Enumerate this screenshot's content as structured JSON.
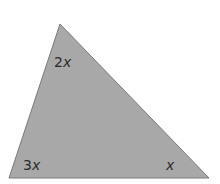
{
  "diagram": {
    "type": "triangle",
    "fill_color": "#a8a8a8",
    "stroke_color": "#7a7a7a",
    "vertices": {
      "top": [
        60,
        24
      ],
      "bottom_left": [
        9,
        178
      ],
      "bottom_right": [
        209,
        178
      ]
    },
    "angles": [
      {
        "position": "top",
        "coefficient": "2",
        "variable": "x"
      },
      {
        "position": "bottom_left",
        "coefficient": "3",
        "variable": "x"
      },
      {
        "position": "bottom_right",
        "coefficient": "",
        "variable": "x"
      }
    ]
  }
}
